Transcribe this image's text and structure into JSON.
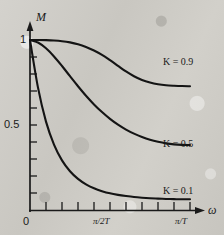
{
  "figure": {
    "kind": "frequency-response-magnitude-plot",
    "background_color": "#cfcdc8",
    "ink_color": "#1a1a1a"
  },
  "axes": {
    "y_axis_label": "M",
    "x_axis_label": "ω",
    "y_ticks_labeled": [
      {
        "value": 1,
        "text": "1",
        "y_px": 40
      },
      {
        "value": 0.5,
        "text": "0.5",
        "y_px": 125
      },
      {
        "value": 0,
        "text": "0",
        "y_px": 210
      }
    ],
    "x_ticks_labeled": [
      {
        "text": "0",
        "x_px": 30
      },
      {
        "text": "π/2T",
        "x_px": 109
      },
      {
        "text": "π/T",
        "x_px": 186
      }
    ],
    "y_minor_tick_count": 10,
    "x_minor_tick_count": 10,
    "origin_px": {
      "x": 30,
      "y": 210
    },
    "x_end_px": 190,
    "y_top_px": 40
  },
  "series_labels": [
    {
      "text": "K = 0.9",
      "x_px": 163,
      "y_px": 57
    },
    {
      "text": "K = 0.5",
      "x_px": 163,
      "y_px": 139
    },
    {
      "text": "K = 0.1",
      "x_px": 163,
      "y_px": 186
    }
  ],
  "chart_data": {
    "type": "line",
    "title": "",
    "xlabel": "ω",
    "ylabel": "M",
    "xlim": [
      0,
      1
    ],
    "ylim": [
      0,
      1.06
    ],
    "grid": false,
    "legend_position": "inline-right",
    "x_tick_labels": [
      "0",
      "π/2T",
      "π/T"
    ],
    "x_tick_values": [
      0,
      0.5,
      1
    ],
    "y_tick_labels": [
      "0",
      "0.5",
      "1"
    ],
    "y_tick_values": [
      0,
      0.5,
      1
    ],
    "x_minor_ticks": [
      0.05,
      0.15,
      0.25,
      0.35,
      0.45,
      0.55,
      0.65,
      0.75,
      0.85,
      0.95
    ],
    "y_minor_ticks": [
      0.05,
      0.15,
      0.25,
      0.35,
      0.45,
      0.55,
      0.65,
      0.75,
      0.85,
      0.95
    ],
    "x": [
      0,
      0.05,
      0.1,
      0.15,
      0.2,
      0.25,
      0.3,
      0.35,
      0.4,
      0.45,
      0.5,
      0.55,
      0.6,
      0.65,
      0.7,
      0.75,
      0.8,
      0.85,
      0.9,
      0.95,
      1
    ],
    "series": [
      {
        "name": "K = 0.9",
        "label": "K = 0.9",
        "values": [
          1.0,
          1.0,
          0.999,
          0.997,
          0.993,
          0.986,
          0.975,
          0.959,
          0.938,
          0.912,
          0.881,
          0.848,
          0.815,
          0.787,
          0.765,
          0.75,
          0.74,
          0.734,
          0.731,
          0.729,
          0.728
        ]
      },
      {
        "name": "K = 0.5",
        "label": "K = 0.5",
        "values": [
          1.0,
          0.985,
          0.951,
          0.903,
          0.847,
          0.787,
          0.728,
          0.672,
          0.621,
          0.576,
          0.536,
          0.502,
          0.473,
          0.449,
          0.429,
          0.413,
          0.401,
          0.392,
          0.386,
          0.383,
          0.382
        ]
      },
      {
        "name": "K = 0.1",
        "label": "K = 0.1",
        "values": [
          1.0,
          0.72,
          0.52,
          0.385,
          0.292,
          0.228,
          0.183,
          0.151,
          0.128,
          0.111,
          0.098,
          0.089,
          0.082,
          0.076,
          0.072,
          0.069,
          0.067,
          0.065,
          0.064,
          0.063,
          0.063
        ]
      }
    ]
  }
}
